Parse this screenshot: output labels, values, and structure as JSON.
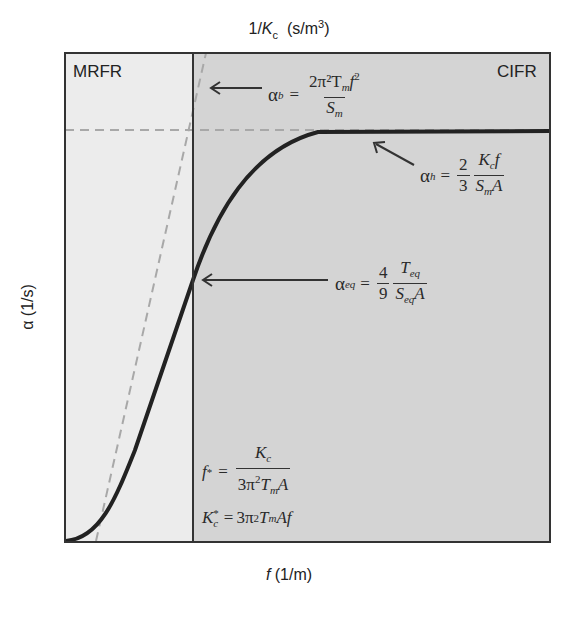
{
  "diagram": {
    "title_axis_top": "1/K c  (s/m³)",
    "axis_top": {
      "pre": "1/",
      "K": "K",
      "sub": "c",
      "post": "  (s/m",
      "sup": "3",
      "close": ")"
    },
    "axis_bottom": {
      "f": "f",
      "unit": " (1/m)"
    },
    "axis_left": {
      "alpha": "α",
      "unit": " (1/s)"
    },
    "regions": {
      "left": "MRFR",
      "right": "CIFR"
    },
    "colors": {
      "mrfr_fill": "#ececec",
      "cifr_fill": "#d4d4d4",
      "curve": "#222222",
      "dashed": "#a8a8a8",
      "frame": "#333333"
    },
    "equations": {
      "alpha_b": {
        "lhs": "α",
        "lhs_sub": "b",
        "eq": "=",
        "num": "2π²T",
        "num_sub": "m",
        "num_f": "f",
        "num_sup": "2",
        "den": "S",
        "den_sub": "m"
      },
      "alpha_h": {
        "lhs": "α",
        "lhs_sub": "h",
        "eq": "=",
        "coef_num": "2",
        "coef_den": "3",
        "num": "K",
        "num_sub": "c",
        "num_f": "f",
        "den": "S",
        "den_sub": "m",
        "den_A": "A"
      },
      "alpha_eq": {
        "lhs": "α",
        "lhs_sub": "eq",
        "eq": "=",
        "coef_num": "4",
        "coef_den": "9",
        "num": "T",
        "num_sub": "eq",
        "den": "S",
        "den_sub": "eq",
        "den_A": "A"
      },
      "f_star": {
        "lhs": "f",
        "lhs_sup": "*",
        "eq": "=",
        "num": "K",
        "num_sub": "c",
        "den_pre": "3π",
        "den_sup": "2",
        "den_T": "T",
        "den_sub": "m",
        "den_A": "A"
      },
      "kc_star": {
        "lhs": "K",
        "lhs_sup": "*",
        "lhs_sub": "c",
        "eq": "=",
        "rhs_pre": "3π",
        "rhs_sup": "2",
        "rhs_T": "T",
        "rhs_sub": "m",
        "rhs_post": "Af"
      }
    },
    "arrow_left": "←"
  }
}
